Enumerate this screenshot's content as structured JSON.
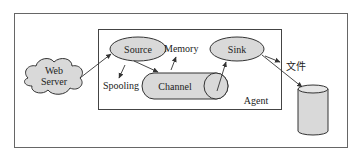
{
  "diagram": {
    "type": "architecture",
    "nodes": {
      "web_server": {
        "line1": "Web",
        "line2": "Server"
      },
      "source": {
        "label": "Source"
      },
      "sink": {
        "label": "Sink"
      },
      "channel": {
        "label": "Channel"
      },
      "agent": {
        "label": "Agent"
      },
      "database": {
        "label": ""
      }
    },
    "annotations": {
      "memory": "Memory",
      "spooling": "Spooling",
      "file": "文件"
    },
    "edges": [
      {
        "from": "web_server",
        "to": "source"
      },
      {
        "from": "source",
        "to": "spooling"
      },
      {
        "from": "source",
        "to": "channel"
      },
      {
        "from": "channel",
        "to": "memory"
      },
      {
        "from": "channel",
        "to": "sink"
      },
      {
        "from": "sink",
        "to": "file"
      },
      {
        "from": "sink",
        "to": "database"
      }
    ],
    "colors": {
      "node_fill": "#d9d9d9",
      "stroke": "#333333",
      "frame": "#555555"
    }
  }
}
